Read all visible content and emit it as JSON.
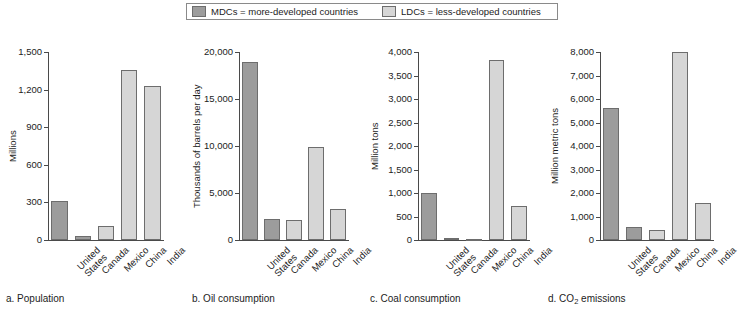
{
  "legend": {
    "entries": [
      {
        "key": "mdc",
        "label": "MDCs = more-developed countries",
        "color": "#9c9c9c"
      },
      {
        "key": "ldc",
        "label": "LDCs = less-developed countries",
        "color": "#d6d6d6"
      }
    ]
  },
  "chart_data": [
    {
      "id": "a",
      "type": "bar",
      "caption": "a. Population",
      "caption_prefix": "a. Population",
      "title": "Population",
      "xlabel": "",
      "ylabel": "Millions",
      "categories": [
        "United\nStates",
        "Canada",
        "Mexico",
        "China",
        "India"
      ],
      "values": [
        310,
        33,
        110,
        1355,
        1230
      ],
      "groups": [
        "mdc",
        "mdc",
        "ldc",
        "ldc",
        "ldc"
      ],
      "ylim": [
        0,
        1500
      ],
      "yticks": [
        0,
        300,
        600,
        900,
        1200,
        1500
      ],
      "yticklabels": [
        "0",
        "300",
        "600",
        "900",
        "1,200",
        "1,500"
      ],
      "grid": false,
      "legend_position": "top-center"
    },
    {
      "id": "b",
      "type": "bar",
      "caption": "b. Oil consumption",
      "caption_prefix": "b. Oil consumption",
      "title": "Oil consumption",
      "xlabel": "",
      "ylabel": "Thousands of barrels per day",
      "categories": [
        "United\nStates",
        "Canada",
        "Mexico",
        "China",
        "India"
      ],
      "values": [
        18900,
        2250,
        2100,
        9850,
        3350
      ],
      "groups": [
        "mdc",
        "mdc",
        "ldc",
        "ldc",
        "ldc"
      ],
      "ylim": [
        0,
        20000
      ],
      "yticks": [
        0,
        5000,
        10000,
        15000,
        20000
      ],
      "yticklabels": [
        "0",
        "5,000",
        "10,000",
        "15,000",
        "20,000"
      ],
      "grid": false,
      "legend_position": "top-center"
    },
    {
      "id": "c",
      "type": "bar",
      "caption": "c. Coal consumption",
      "caption_prefix": "c. Coal consumption",
      "title": "Coal consumption",
      "xlabel": "",
      "ylabel": "Million tons",
      "categories": [
        "United\nStates",
        "Canada",
        "Mexico",
        "China",
        "India"
      ],
      "values": [
        1000,
        50,
        20,
        3820,
        715
      ],
      "groups": [
        "mdc",
        "mdc",
        "ldc",
        "ldc",
        "ldc"
      ],
      "ylim": [
        0,
        4000
      ],
      "yticks": [
        0,
        500,
        1000,
        1500,
        2000,
        2500,
        3000,
        3500,
        4000
      ],
      "yticklabels": [
        "0",
        "500",
        "1,000",
        "1,500",
        "2,000",
        "2,500",
        "3,000",
        "3,500",
        "4,000"
      ],
      "grid": false,
      "legend_position": "top-center"
    },
    {
      "id": "d",
      "type": "bar",
      "caption": "d. CO2 emissions",
      "caption_prefix": "d. CO",
      "caption_sub": "2",
      "caption_suffix": " emissions",
      "title": "CO2 emissions",
      "xlabel": "",
      "ylabel": "Million metric tons",
      "categories": [
        "United\nStates",
        "Canada",
        "Mexico",
        "China",
        "India"
      ],
      "values": [
        5600,
        545,
        420,
        7990,
        1590
      ],
      "groups": [
        "mdc",
        "mdc",
        "ldc",
        "ldc",
        "ldc"
      ],
      "ylim": [
        0,
        8000
      ],
      "yticks": [
        0,
        1000,
        2000,
        3000,
        4000,
        5000,
        6000,
        7000,
        8000
      ],
      "yticklabels": [
        "0",
        "1,000",
        "2,000",
        "3,000",
        "4,000",
        "5,000",
        "6,000",
        "7,000",
        "8,000"
      ],
      "grid": false,
      "legend_position": "top-center"
    }
  ],
  "colors": {
    "mdc": "#9c9c9c",
    "ldc": "#d6d6d6",
    "axis": "#4a4a4a",
    "bar_outline": "#6d6d6d",
    "text": "#1c1c1c"
  }
}
